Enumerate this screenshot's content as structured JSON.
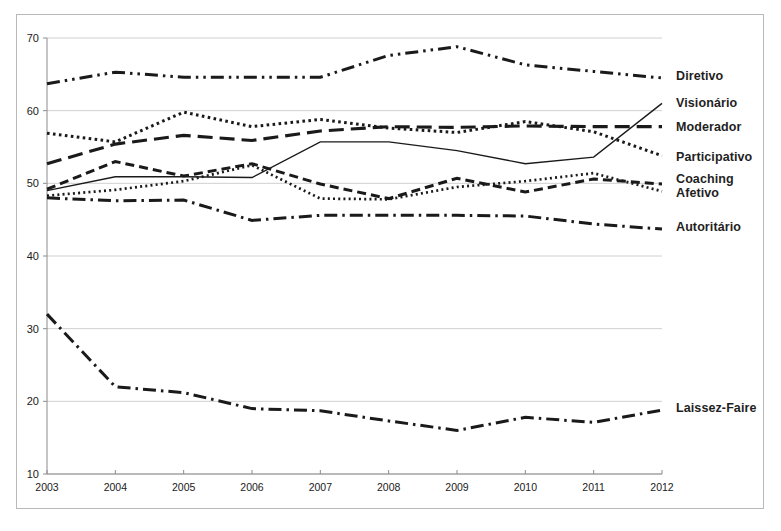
{
  "chart_data": {
    "type": "line",
    "title": "",
    "xlabel": "",
    "ylabel": "",
    "x": [
      2003,
      2004,
      2005,
      2006,
      2007,
      2008,
      2009,
      2010,
      2011,
      2012
    ],
    "categories": [
      "2003",
      "2004",
      "2005",
      "2006",
      "2007",
      "2008",
      "2009",
      "2010",
      "2011",
      "2012"
    ],
    "xlim": [
      2003,
      2012
    ],
    "ylim": [
      10,
      70
    ],
    "yticks": [
      10,
      20,
      30,
      40,
      50,
      60,
      70
    ],
    "xticks": [
      "2003",
      "2004",
      "2005",
      "2006",
      "2007",
      "2008",
      "2009",
      "2010",
      "2011",
      "2012"
    ],
    "grid": "horizontal",
    "legend_position": "right-inline",
    "background": "#ffffff",
    "line_color": "#1a1a1a",
    "grid_color": "#d0d0d0",
    "series": [
      {
        "name": "Diretivo",
        "dash": "dash-dot-dot",
        "values": [
          63.7,
          65.3,
          64.6,
          64.6,
          64.6,
          67.6,
          68.8,
          66.3,
          65.4,
          64.5
        ]
      },
      {
        "name": "Visionário",
        "dash": "solid",
        "values": [
          49.0,
          50.9,
          50.9,
          50.8,
          55.7,
          55.7,
          54.5,
          52.7,
          53.6,
          61.0
        ]
      },
      {
        "name": "Moderador",
        "dash": "long-dash",
        "values": [
          52.7,
          55.4,
          56.6,
          55.9,
          57.2,
          57.8,
          57.7,
          57.9,
          57.8,
          57.8
        ]
      },
      {
        "name": "Participativo",
        "dash": "dotted",
        "values": [
          56.9,
          55.7,
          59.8,
          57.8,
          58.8,
          57.6,
          57.0,
          58.5,
          57.1,
          53.8
        ]
      },
      {
        "name": "Coaching",
        "dash": "dashed",
        "values": [
          49.2,
          53.0,
          51.0,
          52.7,
          49.9,
          47.9,
          50.7,
          48.8,
          50.6,
          49.9
        ]
      },
      {
        "name": "Afetivo",
        "dash": "fine-dotted",
        "values": [
          48.3,
          49.1,
          50.3,
          52.5,
          47.9,
          47.8,
          49.5,
          50.3,
          51.4,
          48.9
        ]
      },
      {
        "name": "Autoritário",
        "dash": "dash-dot",
        "values": [
          48.0,
          47.6,
          47.7,
          44.9,
          45.6,
          45.6,
          45.6,
          45.5,
          44.4,
          43.7
        ]
      },
      {
        "name": "Laissez-Faire",
        "dash": "dash-dot",
        "values": [
          32.0,
          22.0,
          21.2,
          19.0,
          18.7,
          17.3,
          16.0,
          17.8,
          17.1,
          18.8
        ]
      }
    ],
    "labels": [
      {
        "text": "Diretivo",
        "value": 64.5
      },
      {
        "text": "Visionário",
        "value": 61.0
      },
      {
        "text": "Moderador",
        "value": 57.8
      },
      {
        "text": "Participativo",
        "value": 53.8
      },
      {
        "text": "Coaching",
        "value": 49.9
      },
      {
        "text": "Afetivo",
        "value": 48.9
      },
      {
        "text": "Autoritário",
        "value": 43.7
      },
      {
        "text": "Laissez-Faire",
        "value": 18.8
      }
    ]
  }
}
